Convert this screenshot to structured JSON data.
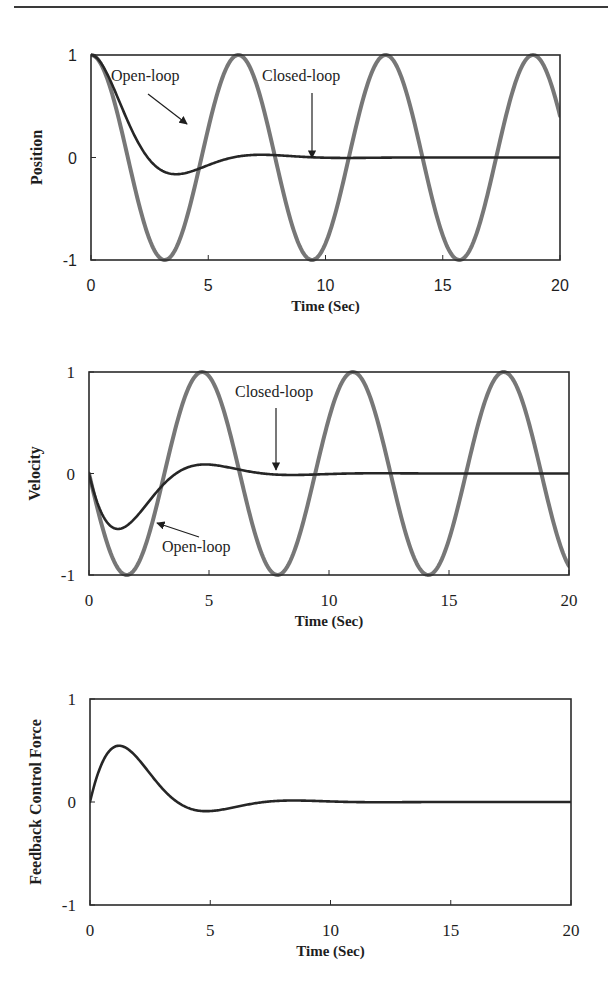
{
  "colors": {
    "frame": "#2b2b2b",
    "closed_loop": "#262626",
    "open_loop": "#777777",
    "text": "#1e1e1e"
  },
  "caption": "",
  "chart_data": [
    {
      "type": "line",
      "name": "position",
      "title": "",
      "xlabel": "Time (Sec)",
      "ylabel": "Position",
      "xlim": [
        0,
        20
      ],
      "ylim": [
        -1,
        1
      ],
      "xticks": [
        0,
        5,
        10,
        15,
        20
      ],
      "yticks": [
        1,
        0,
        -1
      ],
      "xtick_labels": [
        "0",
        "5",
        "10",
        "15",
        "20"
      ],
      "ytick_labels": [
        "1",
        "0",
        "-1"
      ],
      "tick_font": "sans",
      "grid": false,
      "legend": "none (inline arrow annotations)",
      "frame_px": {
        "left": 91,
        "top": 55,
        "right": 560,
        "bottom": 260
      },
      "series": [
        {
          "name": "Open-loop",
          "style": "thick-gray",
          "model": "open_position",
          "x": [
            0,
            1,
            2,
            3,
            3.14,
            4,
            5,
            6,
            6.28,
            7,
            8,
            9,
            9.42,
            10,
            11,
            12,
            12.57,
            13,
            14,
            15,
            15.71,
            16,
            17,
            18,
            18.85,
            19,
            20
          ],
          "values": [
            1,
            0.54,
            -0.42,
            -0.99,
            -1,
            -0.65,
            0.28,
            0.96,
            1,
            0.75,
            -0.15,
            -0.91,
            -1,
            -0.84,
            0.0,
            0.84,
            1,
            0.91,
            0.14,
            -0.76,
            -1,
            -0.96,
            -0.28,
            0.66,
            1,
            0.99,
            0.41
          ]
        },
        {
          "name": "Closed-loop",
          "style": "thin-dark",
          "model": "closed_position",
          "x": [
            0,
            1,
            2,
            3,
            3.63,
            4,
            5,
            6,
            7,
            7.26,
            8,
            9,
            10,
            12,
            15,
            20
          ],
          "values": [
            1,
            0.8,
            0.39,
            -0.05,
            -0.16,
            -0.14,
            -0.06,
            0.01,
            0.03,
            0.03,
            0.02,
            0.0,
            -0.01,
            0.0,
            0.0,
            0.0
          ]
        }
      ],
      "annotations": [
        {
          "text": "Open-loop",
          "text_px": [
            111,
            81
          ],
          "arrow_from_px": [
            148,
            94
          ],
          "arrow_to_px": [
            187,
            124
          ]
        },
        {
          "text": "Closed-loop",
          "text_px": [
            262,
            81
          ],
          "arrow_from_px": [
            312,
            93
          ],
          "arrow_to_px": [
            312,
            158
          ]
        }
      ]
    },
    {
      "type": "line",
      "name": "velocity",
      "title": "",
      "xlabel": "Time (Sec)",
      "ylabel": "Velocity",
      "xlim": [
        0,
        20
      ],
      "ylim": [
        -1,
        1
      ],
      "xticks": [
        0,
        5,
        10,
        15,
        20
      ],
      "yticks": [
        1,
        0,
        -1
      ],
      "xtick_labels": [
        "0",
        "5",
        "10",
        "15",
        "20"
      ],
      "ytick_labels": [
        "1",
        "0",
        "-1"
      ],
      "tick_font": "serif",
      "grid": false,
      "legend": "none (inline arrow annotations)",
      "frame_px": {
        "left": 89,
        "top": 372,
        "right": 569,
        "bottom": 575
      },
      "series": [
        {
          "name": "Open-loop",
          "style": "thick-gray",
          "model": "open_velocity",
          "x": [
            0,
            1,
            1.57,
            2,
            3,
            4,
            4.71,
            5,
            6,
            7,
            7.85,
            8,
            9,
            10,
            11,
            11.0,
            12,
            13,
            14,
            14.14,
            15,
            16,
            17,
            17.28,
            18,
            19,
            20
          ],
          "values": [
            0,
            -0.84,
            -1,
            -0.91,
            -0.14,
            0.76,
            1,
            0.96,
            0.28,
            -0.66,
            -1,
            -0.99,
            -0.41,
            0.54,
            1,
            1,
            0.54,
            -0.42,
            -0.99,
            -1,
            -0.65,
            0.29,
            0.96,
            1,
            0.75,
            -0.15,
            -0.91
          ]
        },
        {
          "name": "Closed-loop",
          "style": "thin-dark",
          "model": "closed_velocity",
          "x": [
            0,
            0.5,
            1,
            1.21,
            2,
            3,
            3.63,
            4,
            4.84,
            5,
            6,
            7,
            7.26,
            8,
            9,
            10,
            12,
            15,
            20
          ],
          "values": [
            0,
            -0.37,
            -0.53,
            -0.54,
            -0.37,
            -0.11,
            0.0,
            0.04,
            0.09,
            0.09,
            0.05,
            0.01,
            0.0,
            -0.01,
            -0.01,
            0.0,
            0.0,
            0.0,
            0.0
          ]
        }
      ],
      "annotations": [
        {
          "text": "Closed-loop",
          "text_px": [
            235,
            397
          ],
          "arrow_from_px": [
            276,
            408
          ],
          "arrow_to_px": [
            276,
            470
          ]
        },
        {
          "text": "Open-loop",
          "text_px": [
            162,
            552
          ],
          "arrow_from_px": [
            199,
            537
          ],
          "arrow_to_px": [
            157,
            523
          ]
        }
      ]
    },
    {
      "type": "line",
      "name": "feedback-control-force",
      "title": "",
      "xlabel": "Time (Sec)",
      "ylabel": "Feedback Control Force",
      "xlim": [
        0,
        20
      ],
      "ylim": [
        -1,
        1
      ],
      "xticks": [
        0,
        5,
        10,
        15,
        20
      ],
      "yticks": [
        1,
        0,
        -1
      ],
      "xtick_labels": [
        "0",
        "5",
        "10",
        "15",
        "20"
      ],
      "ytick_labels": [
        "1",
        "0",
        "-1"
      ],
      "tick_font": "serif",
      "grid": false,
      "legend": "none",
      "frame_px": {
        "left": 90,
        "top": 699,
        "right": 571,
        "bottom": 905
      },
      "series": [
        {
          "name": "Closed-loop control force",
          "style": "thin-dark",
          "model": "closed_force",
          "x": [
            0,
            0.5,
            1,
            1.21,
            2,
            3,
            3.63,
            4,
            4.84,
            5,
            6,
            7,
            7.26,
            8,
            9,
            10,
            12,
            15,
            20
          ],
          "values": [
            0,
            0.37,
            0.53,
            0.54,
            0.37,
            0.11,
            0.0,
            -0.04,
            -0.09,
            -0.09,
            -0.05,
            -0.01,
            0.0,
            0.01,
            0.01,
            0.0,
            0.0,
            0.0,
            0.0
          ]
        }
      ],
      "annotations": []
    }
  ]
}
